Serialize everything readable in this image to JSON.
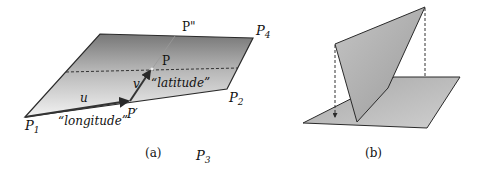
{
  "figure_a": {
    "caption": "(a)",
    "labels": {
      "p1": "P",
      "p1_sub": "1",
      "p2": "P",
      "p2_sub": "2",
      "p3": "P",
      "p3_sub": "3",
      "p4": "P",
      "p4_sub": "4",
      "p_double_prime": "P\"",
      "p": "P",
      "p_prime": "P′",
      "u": "u",
      "v": "v",
      "latitude": "“latitude”",
      "longitude": "“longitude”"
    }
  },
  "figure_b": {
    "caption": "(b)"
  },
  "colors": {
    "plane_dark": "#7a7a7a",
    "plane_light": "#ececec",
    "panel_gray": "#b4b4b4",
    "base_gray": "#bcbcbc",
    "line": "#2a2a2a"
  }
}
